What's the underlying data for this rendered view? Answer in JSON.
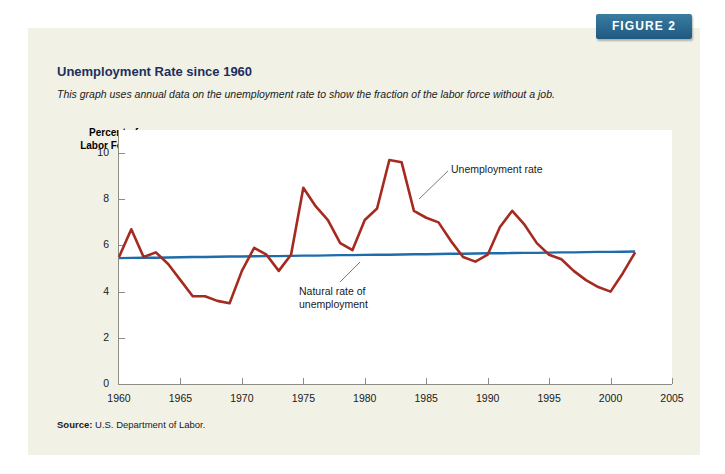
{
  "figure_tab": {
    "label": "FIGURE 2"
  },
  "header": {
    "title": "Unemployment Rate since 1960",
    "subtitle": "This graph uses annual data on the unemployment rate to show the fraction of the labor force without a job."
  },
  "source": {
    "prefix": "Source:",
    "text": "U.S. Department of Labor."
  },
  "colors": {
    "panel_background": "#f2f1e6",
    "plot_background": "#ffffff",
    "title": "#1d2f5e",
    "unemployment_line": "#a52a20",
    "natural_rate_line": "#1f6cab",
    "axis": "#8d8d85",
    "tab": "#2e6c93"
  },
  "chart_data": {
    "type": "line",
    "title": "Unemployment Rate since 1960",
    "subtitle": "This graph uses annual data on the unemployment rate to show the fraction of the labor force without a job.",
    "xlabel": "",
    "ylabel": "Percent of Labor Force",
    "ylabel_lines": [
      "Percent of",
      "Labor Force"
    ],
    "xlim": [
      1960,
      2005
    ],
    "ylim": [
      0,
      11
    ],
    "xticks": [
      1960,
      1965,
      1970,
      1975,
      1980,
      1985,
      1990,
      1995,
      2000,
      2005
    ],
    "yticks": [
      0,
      2,
      4,
      6,
      8,
      10
    ],
    "grid": false,
    "legend_position": "annotations",
    "annotations": [
      {
        "text": "Unemployment rate",
        "target_x": 1983,
        "target_y": 9.7
      },
      {
        "text": "Natural rate of unemployment",
        "lines": [
          "Natural rate of",
          "unemployment"
        ],
        "target_x": 1978,
        "target_y": 5.6
      }
    ],
    "x": [
      1960,
      1961,
      1962,
      1963,
      1964,
      1965,
      1966,
      1967,
      1968,
      1969,
      1970,
      1971,
      1972,
      1973,
      1974,
      1975,
      1976,
      1977,
      1978,
      1979,
      1980,
      1981,
      1982,
      1983,
      1984,
      1985,
      1986,
      1987,
      1988,
      1989,
      1990,
      1991,
      1992,
      1993,
      1994,
      1995,
      1996,
      1997,
      1998,
      1999,
      2000,
      2001,
      2002
    ],
    "series": [
      {
        "name": "Unemployment rate",
        "color": "#a52a20",
        "values": [
          5.5,
          6.7,
          5.5,
          5.7,
          5.2,
          4.5,
          3.8,
          3.8,
          3.6,
          3.5,
          4.9,
          5.9,
          5.6,
          4.9,
          5.6,
          8.5,
          7.7,
          7.1,
          6.1,
          5.8,
          7.1,
          7.6,
          9.7,
          9.6,
          7.5,
          7.2,
          7.0,
          6.2,
          5.5,
          5.3,
          5.6,
          6.8,
          7.5,
          6.9,
          6.1,
          5.6,
          5.4,
          4.9,
          4.5,
          4.2,
          4.0,
          4.8,
          5.7
        ]
      },
      {
        "name": "Natural rate of unemployment",
        "color": "#1f6cab",
        "values": [
          5.45,
          5.46,
          5.47,
          5.47,
          5.48,
          5.49,
          5.5,
          5.5,
          5.51,
          5.52,
          5.52,
          5.53,
          5.54,
          5.54,
          5.55,
          5.56,
          5.56,
          5.57,
          5.58,
          5.58,
          5.59,
          5.6,
          5.6,
          5.61,
          5.62,
          5.62,
          5.63,
          5.64,
          5.64,
          5.65,
          5.66,
          5.66,
          5.67,
          5.68,
          5.68,
          5.69,
          5.7,
          5.7,
          5.71,
          5.72,
          5.72,
          5.73,
          5.74
        ]
      }
    ]
  }
}
